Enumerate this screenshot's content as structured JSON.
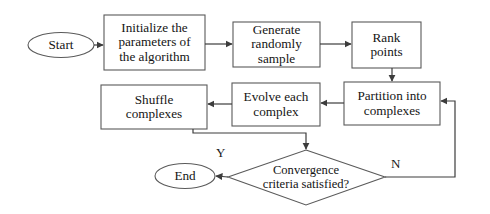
{
  "diagram": {
    "type": "flowchart",
    "background_color": "#ffffff",
    "stroke_color": "#4a4a4a",
    "text_color": "#141414",
    "nodes": {
      "start": {
        "label": "Start",
        "shape": "terminator"
      },
      "initialize": {
        "label": "Initialize the\nparameters of\nthe algorithm",
        "shape": "process"
      },
      "generate": {
        "label": "Generate\nrandomly\nsample",
        "shape": "process"
      },
      "rank": {
        "label": "Rank\npoints",
        "shape": "process"
      },
      "partition": {
        "label": "Partition into\ncomplexes",
        "shape": "process"
      },
      "evolve": {
        "label": "Evolve each\ncomplex",
        "shape": "process"
      },
      "shuffle": {
        "label": "Shuffle\ncomplexes",
        "shape": "process"
      },
      "convergence": {
        "label": "Convergence\ncriteria satisfied?",
        "shape": "decision"
      },
      "end": {
        "label": "End",
        "shape": "terminator"
      }
    },
    "edge_labels": {
      "yes": "Y",
      "no": "N"
    }
  }
}
